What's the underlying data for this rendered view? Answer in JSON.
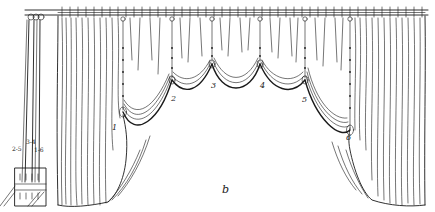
{
  "figure": {
    "caption_letter": "b",
    "ink_color": "#1a1a1a",
    "background": "#ffffff"
  },
  "tie_points": [
    {
      "label": "1",
      "x": 112,
      "y": 118
    },
    {
      "label": "2",
      "x": 172,
      "y": 100
    },
    {
      "label": "3",
      "x": 211,
      "y": 88
    },
    {
      "label": "4",
      "x": 259,
      "y": 88
    },
    {
      "label": "5",
      "x": 303,
      "y": 100
    },
    {
      "label": "6",
      "x": 349,
      "y": 137
    }
  ],
  "rope_board": {
    "labels": [
      {
        "text": "2-5",
        "x": 14,
        "y": 146
      },
      {
        "text": "3-4",
        "x": 27,
        "y": 140
      },
      {
        "text": "1-6",
        "x": 36,
        "y": 149
      }
    ]
  }
}
